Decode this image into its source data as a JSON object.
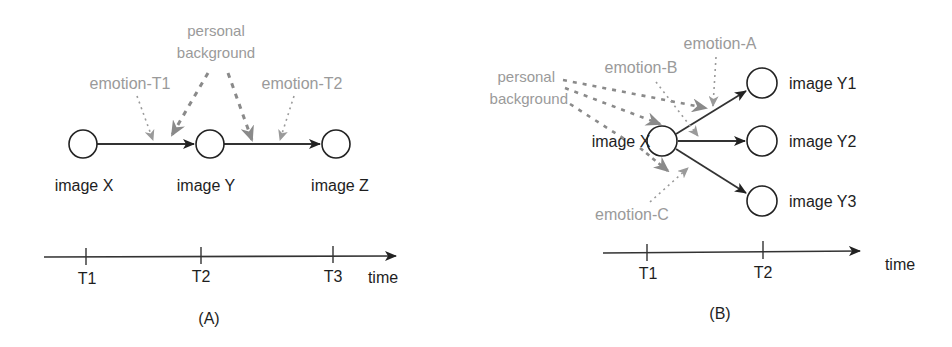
{
  "colors": {
    "dark": "#1e1e1e",
    "gray": "#9a9a9a",
    "line": "#333333"
  },
  "panel_a": {
    "caption": "(A)",
    "nodes": [
      {
        "id": "X",
        "label": "image X"
      },
      {
        "id": "Y",
        "label": "image Y"
      },
      {
        "id": "Z",
        "label": "image Z"
      }
    ],
    "influences": {
      "personal_background_line1": "personal",
      "personal_background_line2": "background",
      "emotion_t1": "emotion-T1",
      "emotion_t2": "emotion-T2"
    },
    "timeline": {
      "ticks": [
        "T1",
        "T2",
        "T3"
      ],
      "axis_label": "time"
    }
  },
  "panel_b": {
    "caption": "(B)",
    "source": {
      "id": "X",
      "label": "image X"
    },
    "targets": [
      {
        "id": "Y1",
        "label": "image Y1"
      },
      {
        "id": "Y2",
        "label": "image Y2"
      },
      {
        "id": "Y3",
        "label": "image Y3"
      }
    ],
    "influences": {
      "personal_background_line1": "personal",
      "personal_background_line2": "background",
      "emotion_a": "emotion-A",
      "emotion_b": "emotion-B",
      "emotion_c": "emotion-C"
    },
    "timeline": {
      "ticks": [
        "T1",
        "T2"
      ],
      "axis_label": "time"
    }
  }
}
